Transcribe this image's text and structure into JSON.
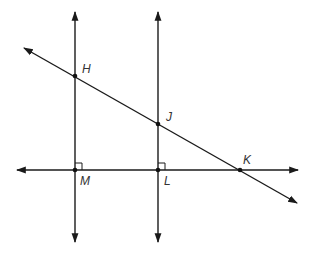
{
  "diagram": {
    "points": [
      {
        "id": "H",
        "label": "H"
      },
      {
        "id": "J",
        "label": "J"
      },
      {
        "id": "K",
        "label": "K"
      },
      {
        "id": "M",
        "label": "M"
      },
      {
        "id": "L",
        "label": "L"
      }
    ],
    "lines": [
      {
        "id": "line-HM",
        "through": [
          "H",
          "M"
        ],
        "type": "line"
      },
      {
        "id": "line-JL",
        "through": [
          "J",
          "L"
        ],
        "type": "line"
      },
      {
        "id": "line-MLK",
        "through": [
          "M",
          "L",
          "K"
        ],
        "type": "line"
      },
      {
        "id": "line-HJK",
        "through": [
          "H",
          "J",
          "K"
        ],
        "type": "line"
      }
    ],
    "right_angles": [
      "M",
      "L"
    ],
    "colors": {
      "stroke": "#1a1a1a",
      "label": "#333333"
    }
  }
}
